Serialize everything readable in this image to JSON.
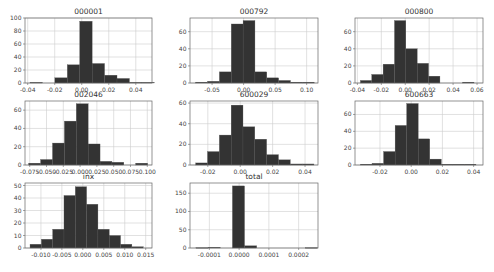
{
  "figure": {
    "background": "#ffffff",
    "bar_color": "#333333",
    "grid_color": "#cccccc"
  },
  "chart_data": [
    {
      "type": "bar",
      "title": "000001",
      "xlabel": "",
      "ylabel": "",
      "grid": true,
      "box": [
        25,
        18,
        152,
        83
      ],
      "xlim": [
        -0.042,
        0.052
      ],
      "ylim": [
        0,
        100
      ],
      "xticks": [
        -0.04,
        -0.02,
        0.0,
        0.02,
        0.04
      ],
      "xtick_labels": [
        "-0.04",
        "-0.02",
        "0.00",
        "0.02",
        "0.04"
      ],
      "yticks": [
        0,
        20,
        40,
        60,
        80,
        100
      ],
      "ytick_labels": [
        "0",
        "20",
        "40",
        "60",
        "80",
        "100"
      ],
      "bin_edges": [
        -0.0383,
        -0.0291,
        -0.0199,
        -0.0107,
        -0.0015,
        0.0077,
        0.0169,
        0.0261,
        0.0353,
        0.0445,
        0.0537
      ],
      "values": [
        1,
        0,
        8,
        28,
        95,
        30,
        12,
        7,
        1,
        1
      ]
    },
    {
      "type": "bar",
      "title": "000792",
      "xlabel": "",
      "ylabel": "",
      "grid": true,
      "box": [
        190,
        18,
        318,
        83
      ],
      "xlim": [
        -0.085,
        0.118
      ],
      "ylim": [
        0,
        76
      ],
      "xticks": [
        -0.05,
        0.0,
        0.05,
        0.1
      ],
      "xtick_labels": [
        "-0.05",
        "0.00",
        "0.05",
        "0.10"
      ],
      "yticks": [
        0,
        20,
        40,
        60
      ],
      "ytick_labels": [
        "0",
        "20",
        "40",
        "60"
      ],
      "bin_edges": [
        -0.076,
        -0.0572,
        -0.0384,
        -0.0196,
        -0.0008,
        0.018,
        0.0368,
        0.0556,
        0.0744,
        0.0932,
        0.112
      ],
      "values": [
        1,
        2,
        13,
        69,
        73,
        13,
        6,
        3,
        1,
        1
      ]
    },
    {
      "type": "bar",
      "title": "000800",
      "xlabel": "",
      "ylabel": "",
      "grid": true,
      "box": [
        355,
        18,
        483,
        83
      ],
      "xlim": [
        -0.042,
        0.065
      ],
      "ylim": [
        0,
        76
      ],
      "xticks": [
        -0.04,
        -0.02,
        0.0,
        0.02,
        0.04,
        0.06
      ],
      "xtick_labels": [
        "-0.04",
        "-0.02",
        "0.00",
        "0.02",
        "0.04",
        "0.06"
      ],
      "yticks": [
        0,
        20,
        40,
        60
      ],
      "ytick_labels": [
        "0",
        "20",
        "40",
        "60"
      ],
      "bin_edges": [
        -0.0375,
        -0.028,
        -0.0185,
        -0.009,
        0.0005,
        0.01,
        0.0195,
        0.029,
        0.0385,
        0.048,
        0.0575,
        0.067
      ],
      "values": [
        3,
        10,
        22,
        73,
        40,
        23,
        8,
        0,
        0,
        1,
        0
      ]
    },
    {
      "type": "bar",
      "title": "002046",
      "xlabel": "",
      "ylabel": "",
      "grid": true,
      "box": [
        25,
        101,
        152,
        165
      ],
      "xlim": [
        -0.082,
        0.107
      ],
      "ylim": [
        0,
        70
      ],
      "xticks": [
        -0.075,
        -0.05,
        -0.025,
        0.0,
        0.025,
        0.05,
        0.075,
        0.1
      ],
      "xtick_labels": [
        "-0.075",
        "-0.050",
        "-0.025",
        "0.000",
        "0.025",
        "0.050",
        "0.075",
        "0.100"
      ],
      "yticks": [
        0,
        20,
        40,
        60
      ],
      "ytick_labels": [
        "0",
        "20",
        "40",
        "60"
      ],
      "bin_edges": [
        -0.0765,
        -0.0588,
        -0.0411,
        -0.0234,
        -0.0057,
        0.012,
        0.0297,
        0.0474,
        0.0651,
        0.0828,
        0.1005
      ],
      "values": [
        2,
        6,
        24,
        48,
        67,
        23,
        4,
        3,
        0,
        2
      ]
    },
    {
      "type": "bar",
      "title": "600029",
      "xlabel": "",
      "ylabel": "",
      "grid": true,
      "box": [
        190,
        101,
        318,
        165
      ],
      "xlim": [
        -0.031,
        0.048
      ],
      "ylim": [
        0,
        62
      ],
      "xticks": [
        -0.02,
        0.0,
        0.02,
        0.04
      ],
      "xtick_labels": [
        "-0.02",
        "0.00",
        "0.02",
        "0.04"
      ],
      "yticks": [
        0,
        20,
        40,
        60
      ],
      "ytick_labels": [
        "0",
        "20",
        "40",
        "60"
      ],
      "bin_edges": [
        -0.0275,
        -0.0202,
        -0.0129,
        -0.0056,
        0.0017,
        0.009,
        0.0163,
        0.0236,
        0.0309,
        0.0382,
        0.0455
      ],
      "values": [
        2,
        13,
        29,
        58,
        37,
        25,
        10,
        5,
        1,
        1
      ]
    },
    {
      "type": "bar",
      "title": "600663",
      "xlabel": "",
      "ylabel": "",
      "grid": true,
      "box": [
        355,
        101,
        483,
        165
      ],
      "xlim": [
        -0.036,
        0.046
      ],
      "ylim": [
        0,
        76
      ],
      "xticks": [
        -0.02,
        0.0,
        0.02,
        0.04
      ],
      "xtick_labels": [
        "-0.02",
        "0.00",
        "0.02",
        "0.04"
      ],
      "yticks": [
        0,
        20,
        40,
        60
      ],
      "ytick_labels": [
        "0",
        "20",
        "40",
        "60"
      ],
      "bin_edges": [
        -0.0325,
        -0.0251,
        -0.0177,
        -0.0103,
        -0.0029,
        0.0045,
        0.0119,
        0.0193,
        0.0267,
        0.0341,
        0.0415
      ],
      "values": [
        1,
        2,
        16,
        47,
        73,
        31,
        7,
        1,
        1,
        1
      ]
    },
    {
      "type": "bar",
      "title": "inx",
      "xlabel": "",
      "ylabel": "",
      "grid": true,
      "box": [
        25,
        183,
        152,
        248
      ],
      "xlim": [
        -0.0138,
        0.0165
      ],
      "ylim": [
        0,
        52
      ],
      "xticks": [
        -0.01,
        -0.005,
        0.0,
        0.005,
        0.01,
        0.015
      ],
      "xtick_labels": [
        "-0.010",
        "-0.005",
        "0.000",
        "0.005",
        "0.010",
        "0.015"
      ],
      "yticks": [
        0,
        10,
        20,
        30,
        40,
        50
      ],
      "ytick_labels": [
        "0",
        "10",
        "20",
        "30",
        "40",
        "50"
      ],
      "bin_edges": [
        -0.0126,
        -0.0099,
        -0.0072,
        -0.0045,
        -0.0018,
        0.0009,
        0.0036,
        0.0063,
        0.009,
        0.0117,
        0.0144
      ],
      "values": [
        3,
        7,
        15,
        42,
        49,
        35,
        15,
        10,
        3,
        1
      ]
    },
    {
      "type": "bar",
      "title": "total",
      "xlabel": "",
      "ylabel": "",
      "grid": true,
      "box": [
        190,
        183,
        318,
        248
      ],
      "xlim": [
        -0.000165,
        0.000265
      ],
      "ylim": [
        0,
        178
      ],
      "xticks": [
        -0.0001,
        0.0,
        0.0001,
        0.0002
      ],
      "xtick_labels": [
        "-0.0001",
        "0.0000",
        "0.0001",
        "0.0002"
      ],
      "yticks": [
        0,
        50,
        100,
        150
      ],
      "ytick_labels": [
        "0",
        "50",
        "100",
        "150"
      ],
      "bin_edges": [
        -0.000145,
        -0.0001042,
        -6.34e-05,
        -2.26e-05,
        1.82e-05,
        5.9e-05,
        9.98e-05,
        0.0001406,
        0.0001814,
        0.0002222,
        0.000263
      ],
      "values": [
        1,
        2,
        0,
        170,
        6,
        0,
        0,
        0,
        0,
        1
      ]
    }
  ]
}
